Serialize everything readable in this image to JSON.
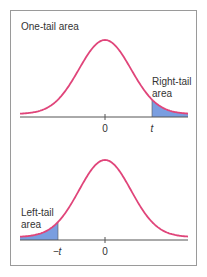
{
  "colors": {
    "curve": "#e0457a",
    "fill": "#7a9ee0",
    "axis": "#555555",
    "border": "#9a9a9a",
    "text": "#333333"
  },
  "panels": [
    {
      "id": "top",
      "title": "One-tail area",
      "tail_label_line1": "Right-tail",
      "tail_label_line2": "area",
      "tick_labels": {
        "center": "0",
        "cutoff": "t"
      },
      "shaded_side": "right"
    },
    {
      "id": "bottom",
      "title": "",
      "tail_label_line1": "Left-tail",
      "tail_label_line2": "area",
      "tick_labels": {
        "center": "0",
        "cutoff": "−t"
      },
      "shaded_side": "left"
    }
  ]
}
